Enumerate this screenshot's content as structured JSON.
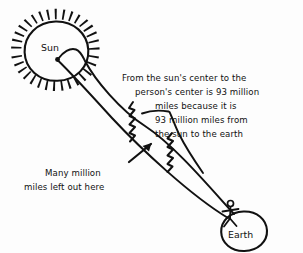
{
  "diagram": {
    "background_color": "#fdfdfd",
    "ink_color": "#111111",
    "sun": {
      "label": "Sun",
      "icon": "sun-icon"
    },
    "earth": {
      "label": "Earth",
      "icon": "earth-icon"
    },
    "person": {
      "icon": "stick-figure-icon"
    },
    "annotation_main": {
      "lines": [
        "From the sun's center to the",
        "person's center is 93 million",
        "miles because it is",
        "93 million miles from",
        "the sun to the earth"
      ]
    },
    "annotation_left": {
      "lines": [
        "Many million",
        "miles left out here"
      ]
    },
    "break_marks": {
      "name": "squiggle-break-icon",
      "count": 2
    },
    "pointer_arrow": {
      "name": "arrow-up-right-icon"
    },
    "leader_line": {
      "name": "leader-line"
    }
  }
}
